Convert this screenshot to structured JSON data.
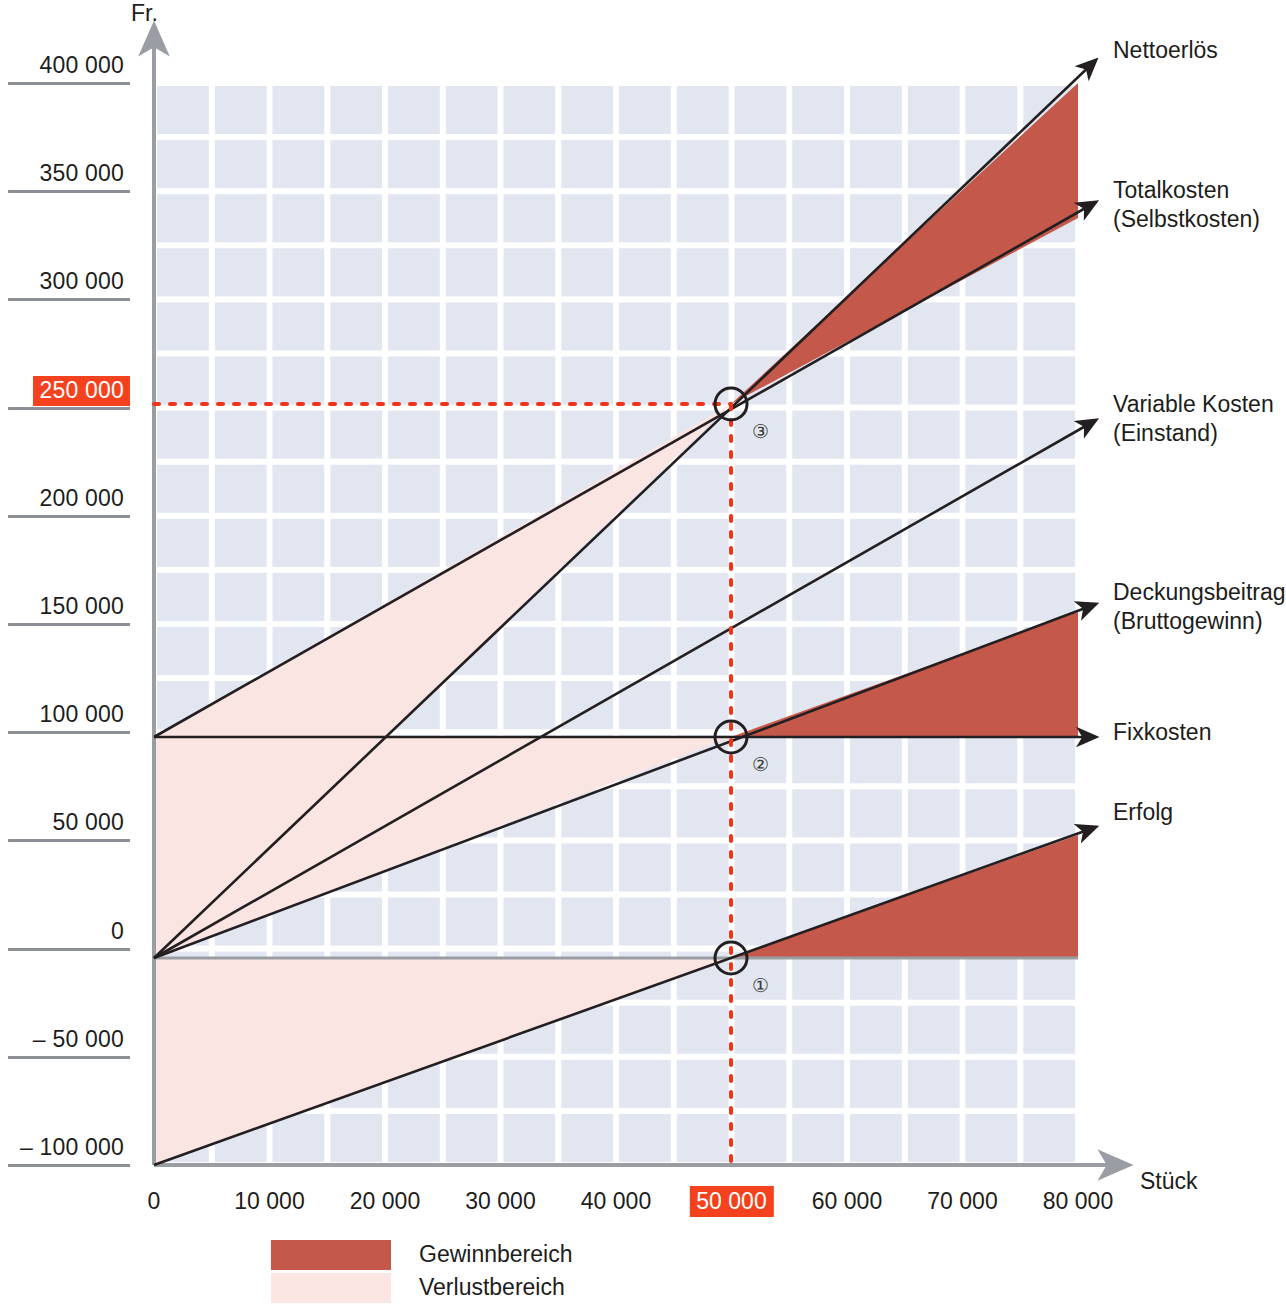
{
  "axes": {
    "y_caption": "Fr.",
    "x_caption": "Stück",
    "y_ticks": [
      {
        "label": "400 000",
        "value": 400000,
        "highlight": false
      },
      {
        "label": "350 000",
        "value": 350000,
        "highlight": false
      },
      {
        "label": "300 000",
        "value": 300000,
        "highlight": false
      },
      {
        "label": "250 000",
        "value": 250000,
        "highlight": true
      },
      {
        "label": "200 000",
        "value": 200000,
        "highlight": false
      },
      {
        "label": "150 000",
        "value": 150000,
        "highlight": false
      },
      {
        "label": "100 000",
        "value": 100000,
        "highlight": false
      },
      {
        "label": "50 000",
        "value": 50000,
        "highlight": false
      },
      {
        "label": "0",
        "value": 0,
        "highlight": false
      },
      {
        "label": "–  50 000",
        "value": -50000,
        "highlight": false
      },
      {
        "label": "– 100 000",
        "value": -100000,
        "highlight": false
      }
    ],
    "x_ticks": [
      {
        "label": "0",
        "value": 0,
        "highlight": false
      },
      {
        "label": "10 000",
        "value": 10000,
        "highlight": false
      },
      {
        "label": "20 000",
        "value": 20000,
        "highlight": false
      },
      {
        "label": "30 000",
        "value": 30000,
        "highlight": false
      },
      {
        "label": "40 000",
        "value": 40000,
        "highlight": false
      },
      {
        "label": "50 000",
        "value": 50000,
        "highlight": true
      },
      {
        "label": "60 000",
        "value": 60000,
        "highlight": false
      },
      {
        "label": "70 000",
        "value": 70000,
        "highlight": false
      },
      {
        "label": "80 000",
        "value": 80000,
        "highlight": false
      }
    ]
  },
  "series_labels": [
    {
      "id": "nettoerloes",
      "lines": [
        "Nettoerlös"
      ]
    },
    {
      "id": "totalkosten",
      "lines": [
        "Totalkosten",
        "(Selbstkosten)"
      ]
    },
    {
      "id": "variable-kosten",
      "lines": [
        "Variable Kosten",
        "(Einstand)"
      ]
    },
    {
      "id": "deckungsbeitrag",
      "lines": [
        "Deckungsbeitrag",
        "(Bruttogewinn)"
      ]
    },
    {
      "id": "fixkosten",
      "lines": [
        "Fixkosten"
      ]
    },
    {
      "id": "erfolg",
      "lines": [
        "Erfolg"
      ]
    }
  ],
  "legend": [
    {
      "id": "gewinnbereich",
      "label": "Gewinnbereich",
      "color": "#c4584a"
    },
    {
      "id": "verlustbereich",
      "label": "Verlustbereich",
      "color": "#fae5e3"
    }
  ],
  "markers": [
    {
      "id": "bep-1",
      "number": "①",
      "x": 50000,
      "y": 0
    },
    {
      "id": "bep-2",
      "number": "②",
      "x": 50000,
      "y": 95000
    },
    {
      "id": "bep-3",
      "number": "③",
      "x": 50000,
      "y": 250000
    }
  ],
  "colors": {
    "profit_fill": "#c4584a",
    "loss_fill": "#fae5e3",
    "grid_block": "#e2e6f0",
    "axis": "#9a9ea4",
    "tick_rule": "#8c9197",
    "highlight": "#f4421e",
    "guide_dotted": "#f0341a",
    "line": "#231f20"
  },
  "chart_data": {
    "type": "line",
    "title": "",
    "xlabel": "Stück",
    "ylabel": "Fr.",
    "xlim": [
      0,
      80000
    ],
    "ylim": [
      -100000,
      400000
    ],
    "grid": true,
    "legend_position": "bottom-left",
    "break_even": {
      "units": 50000,
      "revenue": 250000,
      "fixed_costs": 95000
    },
    "x": [
      0,
      80000
    ],
    "series": [
      {
        "name": "Nettoerlös",
        "values": [
          0,
          400000
        ],
        "note": "Sales revenue from origin through break-even (50 000 / 250 000)"
      },
      {
        "name": "Totalkosten (Selbstkosten)",
        "values": [
          95000,
          343000
        ],
        "note": "Fixed costs 95 000 plus variable costs; crosses Nettoerlös at break-even"
      },
      {
        "name": "Variable Kosten (Einstand)",
        "values": [
          0,
          248000
        ],
        "note": "Variable cost line from origin"
      },
      {
        "name": "Deckungsbeitrag (Bruttogewinn)",
        "values": [
          0,
          152000
        ],
        "note": "Contribution margin from origin, equals Fixkosten at break-even"
      },
      {
        "name": "Fixkosten",
        "values": [
          95000,
          95000
        ],
        "note": "Constant fixed costs"
      },
      {
        "name": "Erfolg",
        "values": [
          -95000,
          57000
        ],
        "note": "Profit/loss line starting at minus fixed costs, crosses zero at break-even"
      }
    ],
    "annotations": [
      {
        "label": "①",
        "x": 50000,
        "y": 0
      },
      {
        "label": "②",
        "x": 50000,
        "y": 95000
      },
      {
        "label": "③",
        "x": 50000,
        "y": 250000
      }
    ]
  }
}
